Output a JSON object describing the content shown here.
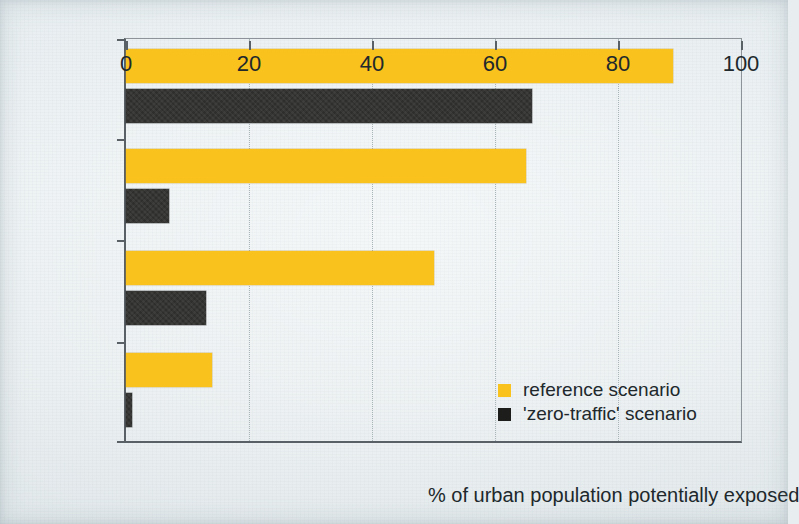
{
  "chart_data": {
    "type": "bar",
    "orientation": "horizontal",
    "title": "",
    "xlabel": "% of urban population potentially exposed",
    "ylabel": "",
    "categories": [
      "PM10",
      "NO2",
      "Benzene",
      "CO"
    ],
    "category_labels_html": [
      "PM<sub>10</sub>",
      "NO<sub>2</sub>",
      "Benzene",
      "CO"
    ],
    "series": [
      {
        "name": "reference scenario",
        "color": "#f9c21c",
        "values": [
          89,
          65,
          50,
          14
        ]
      },
      {
        "name": "'zero-traffic' scenario",
        "color": "#2e2e2c",
        "values": [
          66,
          7,
          13,
          1
        ]
      }
    ],
    "xlim": [
      0,
      100
    ],
    "xticks": [
      0,
      20,
      40,
      60,
      80,
      100
    ],
    "xtick_labels": [
      "0",
      "20",
      "40",
      "60",
      "80",
      "100"
    ],
    "grid": "vertical-dotted",
    "gridlines_at": [
      20,
      40,
      60,
      80
    ],
    "legend_position": "inside-bottom-right",
    "background_color": "#e8eef0"
  },
  "legend": {
    "items": [
      {
        "label": "reference scenario",
        "color": "#f9c21c",
        "swatch": "square-yellow-swatch"
      },
      {
        "label": "'zero-traffic' scenario",
        "color": "#2e2e2c",
        "swatch": "square-black-swatch"
      }
    ]
  },
  "axis": {
    "x_title": "% of urban population potentially exposed"
  }
}
